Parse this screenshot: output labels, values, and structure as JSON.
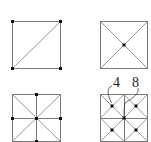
{
  "figure": {
    "panels": [
      {
        "id": "panel-1",
        "content": "square with one diagonal, nodes at four corners"
      },
      {
        "id": "panel-2",
        "content": "square with both diagonals, node at center"
      },
      {
        "id": "panel-3",
        "content": "square with both diagonals and midlines, nodes at edge midpoints and center"
      },
      {
        "id": "panel-4",
        "content": "square split into 2x2 cells each with diagonals, nodes at cell centers and overall center"
      }
    ],
    "labels": [
      {
        "text": "4",
        "points_to": "top-left cell center node"
      },
      {
        "text": "8",
        "points_to": "overall center node"
      }
    ]
  },
  "colors": {
    "line": "#7a7a7a",
    "node": "#111111",
    "label": "#222222"
  }
}
